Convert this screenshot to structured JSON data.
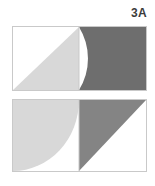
{
  "figure": {
    "label": "3A",
    "background_color": "#ffffff",
    "outline_color": "#c9c9c9",
    "light_gray": "#d8d8d8",
    "mid_gray": "#848484",
    "dark_gray": "#6e6e6e",
    "white_fill": "#ffffff",
    "panels": [
      {
        "id": "top",
        "name": "top-panel",
        "cells": [
          {
            "id": "top-left",
            "name": "top-left-cell",
            "shape": "triangle",
            "description": "light gray right triangle with vertices at bottom-left, top-right, bottom-right",
            "fill": "#d8d8d8"
          },
          {
            "id": "top-right",
            "name": "top-right-cell",
            "shape": "quarter-circle-complement",
            "description": "dark gray square corner with a white quarter circle cut from the bottom-left, arc centered at bottom-left corner",
            "fill": "#6e6e6e"
          }
        ]
      },
      {
        "id": "bottom",
        "name": "bottom-panel",
        "cells": [
          {
            "id": "bottom-left",
            "name": "bottom-left-cell",
            "shape": "quarter-circle-complement",
            "description": "light gray square corner with a white quarter circle cut from the top-right, arc centered at top-right corner",
            "fill": "#d8d8d8"
          },
          {
            "id": "bottom-right",
            "name": "bottom-right-cell",
            "shape": "triangle",
            "description": "mid gray right triangle occupying the upper-left half, vertices at top-left, top-right, bottom-left",
            "fill": "#848484"
          }
        ]
      }
    ]
  }
}
